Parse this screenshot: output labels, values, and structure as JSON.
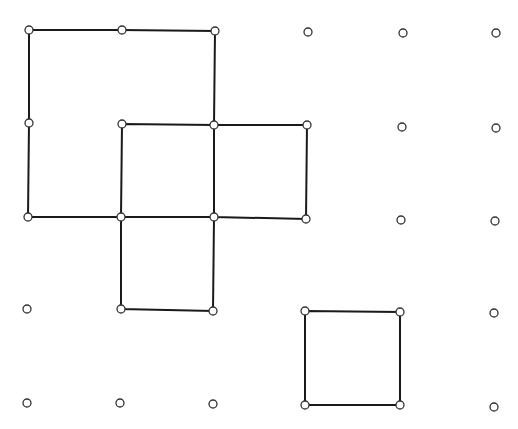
{
  "diagram": {
    "colors": {
      "line": "#1a1a1a",
      "dot_stroke": "#333333",
      "dot_fill": "#ffffff",
      "background": "#ffffff"
    },
    "grid": {
      "rows": [
        [
          [
            29,
            30
          ],
          [
            122,
            30
          ],
          [
            215,
            31
          ],
          [
            308,
            32
          ],
          [
            403,
            33
          ],
          [
            496,
            33
          ]
        ],
        [
          [
            29,
            123
          ],
          [
            122,
            124
          ],
          [
            214,
            125
          ],
          [
            307,
            125
          ],
          [
            402,
            127
          ],
          [
            496,
            128
          ]
        ],
        [
          [
            28,
            217
          ],
          [
            121,
            217
          ],
          [
            214,
            217
          ],
          [
            306,
            219
          ],
          [
            401,
            220
          ],
          [
            495,
            221
          ]
        ],
        [
          [
            27,
            309
          ],
          [
            121,
            309
          ],
          [
            213,
            311
          ],
          [
            305,
            311
          ],
          [
            400,
            312
          ],
          [
            494,
            313
          ]
        ],
        [
          [
            27,
            403
          ],
          [
            120,
            403
          ],
          [
            213,
            404
          ],
          [
            305,
            405
          ],
          [
            400,
            405
          ],
          [
            494,
            407
          ]
        ]
      ]
    },
    "polygons": [
      {
        "name": "large-square",
        "points": [
          [
            29,
            30
          ],
          [
            122,
            30
          ],
          [
            215,
            31
          ],
          [
            214,
            125
          ],
          [
            214,
            217
          ],
          [
            121,
            217
          ],
          [
            28,
            217
          ],
          [
            29,
            123
          ]
        ]
      },
      {
        "name": "center-square",
        "points": [
          [
            122,
            124
          ],
          [
            214,
            125
          ],
          [
            214,
            217
          ],
          [
            121,
            217
          ]
        ]
      },
      {
        "name": "right-square",
        "points": [
          [
            214,
            125
          ],
          [
            307,
            125
          ],
          [
            306,
            219
          ],
          [
            214,
            217
          ]
        ]
      },
      {
        "name": "bottom-square",
        "points": [
          [
            121,
            217
          ],
          [
            214,
            217
          ],
          [
            213,
            311
          ],
          [
            121,
            309
          ]
        ]
      },
      {
        "name": "lower-right-square",
        "points": [
          [
            305,
            311
          ],
          [
            400,
            312
          ],
          [
            400,
            405
          ],
          [
            305,
            405
          ]
        ]
      }
    ]
  }
}
